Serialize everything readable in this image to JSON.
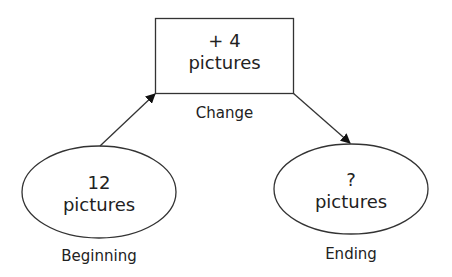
{
  "diagram": {
    "type": "change-problem-flow",
    "nodes": {
      "beginning": {
        "value": "12",
        "unit": "pictures",
        "caption": "Beginning",
        "shape": "ellipse"
      },
      "change": {
        "value": "+ 4",
        "unit": "pictures",
        "caption": "Change",
        "shape": "rectangle"
      },
      "ending": {
        "value": "?",
        "unit": "pictures",
        "caption": "Ending",
        "shape": "ellipse"
      }
    },
    "edges": [
      {
        "from": "beginning",
        "to": "change"
      },
      {
        "from": "change",
        "to": "ending"
      }
    ],
    "colors": {
      "stroke": "#222222",
      "background": "#ffffff"
    }
  }
}
